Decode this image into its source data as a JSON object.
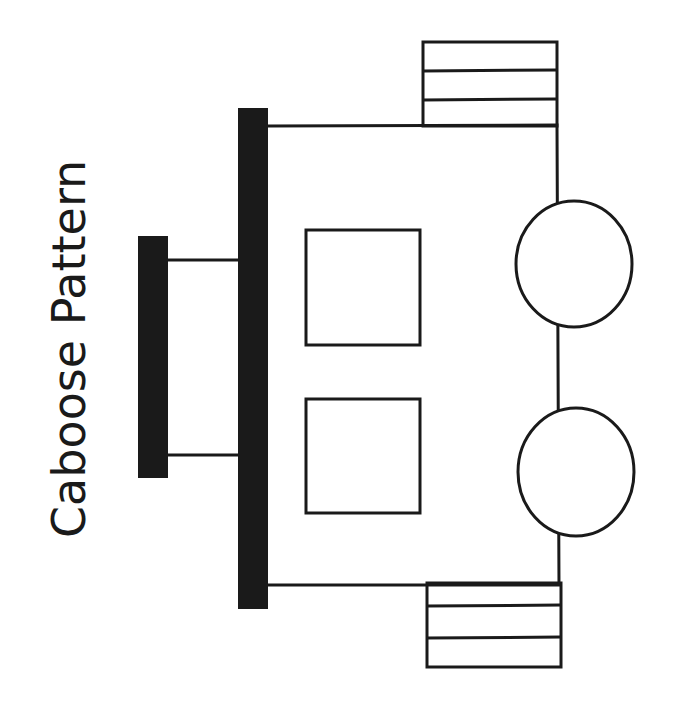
{
  "title": "Caboose Pattern",
  "colors": {
    "stroke": "#1a1a1a",
    "fill": "#ffffff",
    "roof": "#1a1a1a"
  },
  "parts": {
    "cupola_roof": {
      "x": 138,
      "y": 236,
      "w": 30,
      "h": 242
    },
    "main_roof": {
      "x": 238,
      "y": 108,
      "w": 30,
      "h": 501
    },
    "cupola_posts": [
      {
        "y": 260
      },
      {
        "y": 455
      }
    ],
    "body": {
      "x1": 268,
      "y1": 126,
      "x2": 559,
      "y2": 585
    },
    "windows": [
      {
        "x": 305,
        "y": 229,
        "w": 116,
        "h": 117
      },
      {
        "x": 305,
        "y": 398,
        "w": 116,
        "h": 116
      }
    ],
    "wheels": [
      {
        "cx": 574,
        "cy": 264,
        "rx": 59,
        "ry": 63
      },
      {
        "cx": 576,
        "cy": 472,
        "rx": 59,
        "ry": 64
      }
    ],
    "ladders": [
      {
        "x": 423,
        "y": 42,
        "w": 134,
        "h": 84,
        "rungs": [
          71,
          100
        ]
      },
      {
        "x": 427,
        "y": 583,
        "w": 134,
        "h": 84,
        "rungs": [
          606,
          638
        ]
      }
    ]
  }
}
